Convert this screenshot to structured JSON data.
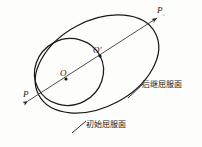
{
  "figure": {
    "background_color": "#fdfdfc",
    "stroke_color": "#1a1a1a",
    "width": 202,
    "height": 147
  },
  "labels": {
    "p_start": "P",
    "p_end_base": "P",
    "p_end_sub": "◦",
    "center_initial": "O",
    "center_subsequent": "O",
    "center_subsequent_prime": "′",
    "subsequent_yield_surface": "后继屈服面",
    "initial_yield_surface": "初始屈服面"
  },
  "shapes": {
    "initial_ellipse": {
      "name": "initial-yield-surface-ellipse",
      "cx": 69,
      "cy": 72,
      "rx": 35,
      "ry": 33,
      "rotate": -28
    },
    "subsequent_ellipse": {
      "name": "subsequent-yield-surface-ellipse",
      "cx": 97,
      "cy": 64,
      "rx": 66,
      "ry": 43,
      "rotate": -28
    },
    "axis_arrow": {
      "name": "loading-path-axis",
      "x1": 28,
      "y1": 101,
      "x2": 157,
      "y2": 18
    },
    "point_O": {
      "cx": 66,
      "cy": 79
    },
    "point_O_prime": {
      "cx": 100,
      "cy": 56
    }
  }
}
